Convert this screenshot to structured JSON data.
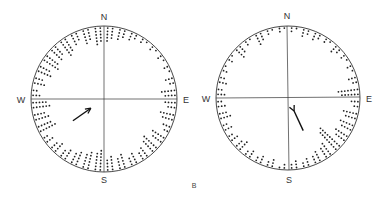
{
  "figure": {
    "panel_label": "B"
  },
  "chart_data": {
    "type": "circular-dot-histogram",
    "title": "",
    "panel_label": "B",
    "bin_size_deg": 10,
    "charts": [
      {
        "name": "left-diagram",
        "compass": {
          "N": "N",
          "E": "E",
          "S": "S",
          "W": "W"
        },
        "mean_vector": {
          "bearing_deg": 55,
          "length_rel": 0.3,
          "note": "arrow in SW quadrant pointing NE"
        },
        "bins_start_deg": [
          0,
          10,
          20,
          30,
          40,
          50,
          60,
          70,
          80,
          90,
          100,
          110,
          120,
          130,
          140,
          150,
          160,
          170,
          180,
          190,
          200,
          210,
          220,
          230,
          240,
          250,
          260,
          270,
          280,
          290,
          300,
          310,
          320,
          330,
          340,
          350
        ],
        "counts": [
          5,
          4,
          3,
          2,
          2,
          2,
          2,
          3,
          5,
          4,
          5,
          3,
          5,
          6,
          4,
          4,
          5,
          5,
          7,
          6,
          5,
          4,
          4,
          3,
          6,
          5,
          6,
          3,
          4,
          5,
          6,
          5,
          6,
          4,
          5,
          6
        ]
      },
      {
        "name": "right-diagram",
        "compass": {
          "N": "N",
          "E": "E",
          "S": "S",
          "W": "W"
        },
        "mean_vector": {
          "bearing_deg": 155,
          "length_rel": 0.3,
          "note": "arrow in SE quadrant pointing SSE"
        },
        "bins_start_deg": [
          0,
          10,
          20,
          30,
          40,
          50,
          60,
          70,
          80,
          90,
          100,
          110,
          120,
          130,
          140,
          150,
          160,
          170,
          180,
          190,
          200,
          210,
          220,
          230,
          240,
          250,
          260,
          270,
          280,
          290,
          300,
          310,
          320,
          330,
          340,
          350
        ],
        "counts": [
          2,
          3,
          3,
          2,
          3,
          2,
          2,
          3,
          7,
          3,
          5,
          5,
          5,
          9,
          5,
          4,
          3,
          3,
          2,
          3,
          3,
          3,
          4,
          3,
          3,
          4,
          3,
          3,
          3,
          2,
          2,
          4,
          2,
          4,
          2,
          2
        ]
      }
    ]
  }
}
